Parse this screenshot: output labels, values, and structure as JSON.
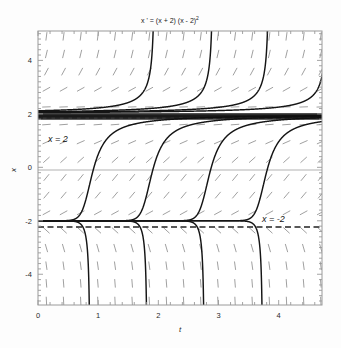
{
  "chart_data": {
    "type": "line",
    "title": "x ' = (x + 2) (x - 2)",
    "title_exponent": "2",
    "xlabel": "t",
    "ylabel": "x",
    "xlim": [
      0,
      4.72
    ],
    "ylim": [
      -5.15,
      5.1
    ],
    "xticks": [
      0,
      1,
      2,
      3,
      4
    ],
    "xticklabels": [
      "0",
      "1",
      "2",
      "3",
      "4"
    ],
    "yticks": [
      4,
      2,
      0,
      -2,
      -4
    ],
    "yticklabels": [
      "4",
      "2",
      "0",
      "-2",
      "-4"
    ],
    "grid": false,
    "legend": "none",
    "equation": "x' = (x + 2)(x - 2)^2",
    "equilibria": [
      {
        "value": 2,
        "label": "x = 2",
        "stability": "semi-stable",
        "style": "dashed"
      },
      {
        "value": -2,
        "label": "x = -2",
        "stability": "unstable",
        "style": "dashed"
      }
    ],
    "annotations": [
      {
        "text": "x = 2",
        "t": 0.28,
        "x": 1.35
      },
      {
        "text": "x = -2",
        "t": 3.55,
        "x": -1.45
      }
    ],
    "slope_field": {
      "t_start": 0.14,
      "t_step": 0.285,
      "t_count": 17,
      "x_start": -5.0,
      "x_step": 0.66,
      "x_count": 16,
      "description": "dashed tick marks showing direction field of x' = (x+2)(x-2)^2"
    },
    "solution_curves": [
      {
        "name": "upper-blowup-1",
        "region": "x > 2",
        "asymptote_t": 1.03
      },
      {
        "name": "upper-blowup-2",
        "region": "x > 2",
        "asymptote_t": 2.0
      },
      {
        "name": "upper-blowup-3",
        "region": "x > 2",
        "asymptote_t": 2.93
      },
      {
        "name": "upper-blowup-4",
        "region": "x > 2",
        "asymptote_t": 3.9
      },
      {
        "name": "mid-rise-1",
        "region": "-2 < x < 2",
        "x_zero_crossing_t": 0.93
      },
      {
        "name": "mid-rise-2",
        "region": "-2 < x < 2",
        "x_zero_crossing_t": 1.92
      },
      {
        "name": "mid-rise-3",
        "region": "-2 < x < 2",
        "x_zero_crossing_t": 2.88
      },
      {
        "name": "mid-rise-4",
        "region": "-2 < x < 2",
        "x_zero_crossing_t": 3.82
      },
      {
        "name": "lower-drop-1",
        "region": "x < -2",
        "asymptote_t": 1.05
      },
      {
        "name": "lower-drop-2",
        "region": "x < -2",
        "asymptote_t": 2.0
      },
      {
        "name": "lower-drop-3",
        "region": "x < -2",
        "asymptote_t": 2.95
      },
      {
        "name": "lower-drop-4",
        "region": "x < -2",
        "asymptote_t": 3.92
      }
    ],
    "colors": {
      "curve": "#151515",
      "slope_field": "#8b8b8b",
      "axis": "#9a9a9a",
      "frame": "#9a9a9a",
      "background": "#fdfdfd",
      "text": "#1a1a1a"
    }
  }
}
